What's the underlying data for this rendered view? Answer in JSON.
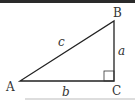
{
  "diagram": {
    "type": "right-triangle",
    "vertices": {
      "A": "A",
      "B": "B",
      "C": "C"
    },
    "sides": {
      "hypotenuse": "c",
      "vertical": "a",
      "base": "b"
    },
    "right_angle_at": "C",
    "stroke_color": "#222222"
  }
}
